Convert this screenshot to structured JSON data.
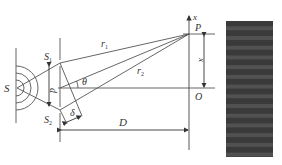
{
  "diagram": {
    "labels": {
      "source": "S",
      "slit1": "S",
      "slit1_sub": "1",
      "slit2": "S",
      "slit2_sub": "2",
      "slit_separation": "d",
      "path1": "r",
      "path1_sub": "1",
      "path2": "r",
      "path2_sub": "2",
      "angle": "θ",
      "path_difference": "δ",
      "distance": "D",
      "point": "P",
      "origin": "O",
      "axis": "x",
      "position": "x"
    },
    "colors": {
      "line": "#555555",
      "fringe_dark": "#2e2e2e",
      "fringe_light": "#5a5a5a",
      "background": "#ffffff"
    },
    "fringe_pattern": {
      "bands": 14
    }
  }
}
